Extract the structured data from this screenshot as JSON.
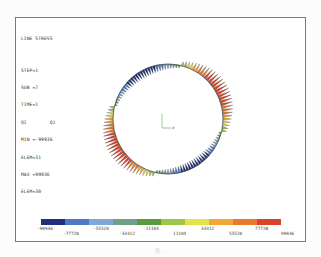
{
  "info": {
    "title": "LINE STRESS",
    "step": "STEP=1",
    "sub": "SUB =7",
    "time": "TIME=1",
    "qi_qj": "QI        QJ",
    "min": "MIN =-99936",
    "min_elem": "ELEM=31",
    "max": "MAX =99936",
    "max_elem": "ELEM=30"
  },
  "triad": {
    "axis_label": "x"
  },
  "legend": {
    "colors": [
      "#1f2f7a",
      "#4d78c4",
      "#7fa8d8",
      "#6f9f8a",
      "#5a9a3e",
      "#9bc64a",
      "#e4e24e",
      "#f0a838",
      "#e67a2e",
      "#d9442a"
    ],
    "labels_top": [
      "-99936",
      "-55520",
      "-11104",
      "33312",
      "77728"
    ],
    "labels_bottom": [
      "-77728",
      "-33312",
      "11104",
      "55520",
      "99936"
    ]
  },
  "chart_data": {
    "type": "heatmap",
    "title": "LINE STRESS",
    "legend_values": [
      -99936,
      -77728,
      -55520,
      -33312,
      -11104,
      11104,
      33312,
      55520,
      77728,
      99936
    ],
    "min": -99936,
    "min_elem": 31,
    "max": 99936,
    "max_elem": 30,
    "step": 1,
    "sub": 7,
    "time": 1
  },
  "caption": "图 ..."
}
